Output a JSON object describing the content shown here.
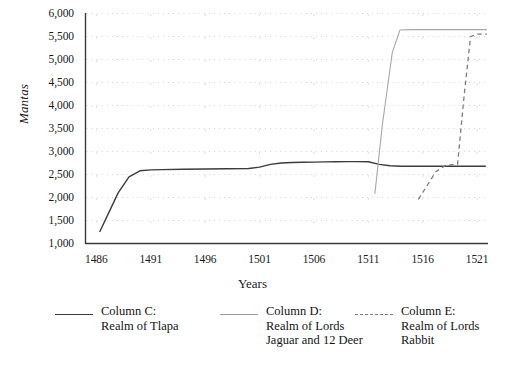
{
  "chart_data": {
    "type": "line",
    "title": "",
    "xlabel": "Years",
    "ylabel": "Mantas",
    "xlim": [
      1485,
      1522
    ],
    "ylim": [
      1000,
      6000
    ],
    "grid": true,
    "grid_style": "dotted",
    "legend_position": "bottom",
    "yticks": [
      "1,000",
      "1,500",
      "2,000",
      "2,500",
      "3,000",
      "3,500",
      "4,000",
      "4,500",
      "5,000",
      "5,500",
      "6,000"
    ],
    "ytick_values": [
      1000,
      1500,
      2000,
      2500,
      3000,
      3500,
      4000,
      4500,
      5000,
      5500,
      6000
    ],
    "xticks": [
      "1486",
      "1491",
      "1496",
      "1501",
      "1506",
      "1511",
      "1516",
      "1521"
    ],
    "xtick_values": [
      1486,
      1491,
      1496,
      1501,
      1506,
      1511,
      1516,
      1521
    ],
    "series": [
      {
        "name": "Column C: Realm of Tlapa",
        "legend_label": "Column C:\nRealm of Tlapa",
        "color": "#3c3c3c",
        "style": "solid",
        "width": 1.4,
        "x": [
          1486.3,
          1487,
          1488,
          1489,
          1490,
          1491,
          1492,
          1494,
          1496,
          1498,
          1500,
          1501,
          1502,
          1503,
          1504,
          1505,
          1506,
          1507,
          1508,
          1509,
          1510,
          1511,
          1512,
          1513,
          1514,
          1515,
          1516,
          1517,
          1518,
          1519,
          1520,
          1521,
          1521.8
        ],
        "y": [
          1250,
          1600,
          2100,
          2450,
          2580,
          2600,
          2605,
          2615,
          2620,
          2625,
          2630,
          2660,
          2720,
          2750,
          2760,
          2765,
          2770,
          2775,
          2778,
          2780,
          2780,
          2778,
          2720,
          2690,
          2680,
          2680,
          2680,
          2680,
          2680,
          2680,
          2680,
          2680,
          2680
        ]
      },
      {
        "name": "Column D: Realm of Lords Jaguar and 12 Deer",
        "legend_label": "Column D:\nRealm of Lords\nJaguar and 12 Deer",
        "color": "#a8a8a8",
        "style": "solid",
        "width": 1.1,
        "x": [
          1511.6,
          1512.3,
          1513.2,
          1513.9,
          1515,
          1517,
          1519,
          1521,
          1521.9
        ],
        "y": [
          2080,
          3600,
          5150,
          5640,
          5650,
          5650,
          5650,
          5650,
          5650
        ]
      },
      {
        "name": "Column E: Realm of Lords Rabbit",
        "legend_label": "Column E:\nRealm of Lords\nRabbit",
        "color": "#7d7d7d",
        "style": "dashed",
        "width": 1.3,
        "x": [
          1515.6,
          1517.2,
          1518.1,
          1519.2,
          1519.8,
          1520.4,
          1521,
          1521.9
        ],
        "y": [
          1960,
          2560,
          2700,
          2720,
          4200,
          5500,
          5550,
          5550
        ]
      }
    ]
  }
}
